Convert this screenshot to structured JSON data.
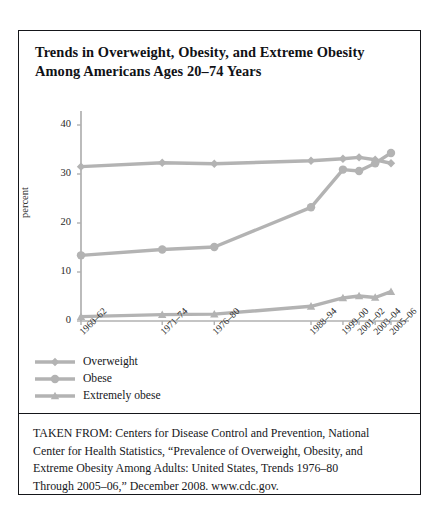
{
  "figure": {
    "title_lines": [
      "Trends in Overweight, Obesity, and Extreme Obesity",
      "Among Americans Ages 20–74 Years"
    ],
    "frame_color": "#15161a"
  },
  "chart_data": {
    "type": "line",
    "title": "Trends in Overweight, Obesity, and Extreme Obesity Among Americans Ages 20–74 Years",
    "xlabel": "",
    "ylabel": "percent",
    "categories": [
      "1960–62",
      "1971–74",
      "1976–80",
      "1988–94",
      "1999–00",
      "2001–02",
      "2003–04",
      "2005–06"
    ],
    "ylim": [
      0,
      40
    ],
    "yticks": [
      0,
      10,
      20,
      30,
      40
    ],
    "ytick_labels": [
      "0",
      "10",
      "20",
      "30",
      "40"
    ],
    "grid": false,
    "legend_position": "below-left",
    "series": [
      {
        "name": "Overweight",
        "marker": "diamond",
        "color": "#b3b3b3",
        "values": [
          31.5,
          32.3,
          32.1,
          32.7,
          33.1,
          33.4,
          32.9,
          32.2
        ]
      },
      {
        "name": "Obese",
        "marker": "circle",
        "color": "#b3b3b3",
        "values": [
          13.4,
          14.6,
          15.1,
          23.2,
          30.9,
          30.6,
          32.2,
          34.3
        ]
      },
      {
        "name": "Extremely obese",
        "marker": "triangle",
        "color": "#b3b3b3",
        "values": [
          0.9,
          1.3,
          1.4,
          3.0,
          4.7,
          5.1,
          4.8,
          6.0
        ]
      }
    ]
  },
  "legend": {
    "items": [
      {
        "label": "Overweight",
        "marker": "diamond"
      },
      {
        "label": "Obese",
        "marker": "circle"
      },
      {
        "label": "Extremely obese",
        "marker": "triangle"
      }
    ]
  },
  "source": {
    "lines": [
      "TAKEN FROM: Centers for Disease Control and Prevention, National",
      "Center for Health Statistics, “Prevalence of Overweight, Obesity, and",
      "Extreme Obesity Among Adults: United States, Trends 1976–80",
      "Through 2005–06,” December 2008. www.cdc.gov."
    ]
  }
}
